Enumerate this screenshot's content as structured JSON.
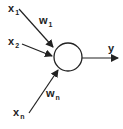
{
  "diagram": {
    "type": "perceptron",
    "stroke_color": "#222222",
    "background": "#ffffff",
    "neuron": {
      "cx": 68,
      "cy": 57,
      "r": 14
    },
    "inputs": [
      {
        "base": "x",
        "sub": "1",
        "label_pos": [
          8,
          3
        ],
        "arrow": [
          19,
          9,
          53,
          47
        ],
        "weight": {
          "base": "w",
          "sub": "1",
          "label_pos": [
            39,
            15
          ]
        }
      },
      {
        "base": "x",
        "sub": "2",
        "label_pos": [
          8,
          36
        ],
        "arrow": [
          22,
          44,
          52,
          56
        ]
      },
      {
        "base": "x",
        "sub": "n",
        "label_pos": [
          13,
          107
        ],
        "arrow": [
          29,
          113,
          58,
          70
        ],
        "weight": {
          "base": "w",
          "sub": "n",
          "label_pos": [
            46,
            88
          ]
        }
      }
    ],
    "output": {
      "label": "y",
      "label_pos": [
        108,
        43
      ],
      "arrow": [
        82,
        58,
        118,
        58
      ]
    }
  }
}
